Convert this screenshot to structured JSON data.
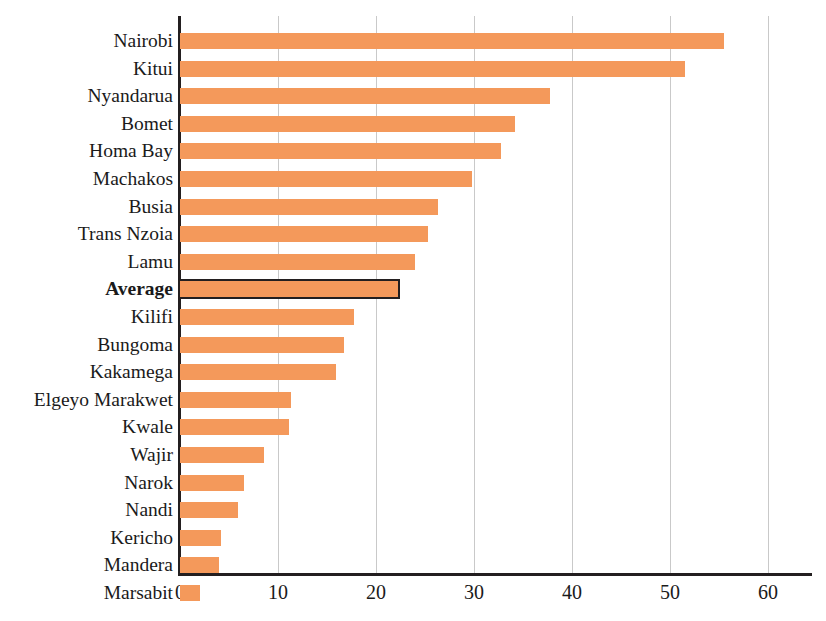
{
  "chart_data": {
    "type": "bar",
    "orientation": "horizontal",
    "title": "",
    "subtitle": "",
    "xlabel": "",
    "ylabel": "",
    "xlim": [
      0,
      65
    ],
    "xticks": [
      0,
      10,
      20,
      30,
      40,
      50,
      60
    ],
    "xtick_labels": [
      "0",
      "10",
      "20",
      "30",
      "40",
      "50",
      "60"
    ],
    "grid": "vertical",
    "legend": "none",
    "bar_color": "#F4995B",
    "highlight_color": "#231f20",
    "categories": [
      "Nairobi",
      "Kitui",
      "Nyandarua",
      "Bomet",
      "Homa Bay",
      "Machakos",
      "Busia",
      "Trans Nzoia",
      "Lamu",
      "Average",
      "Kilifi",
      "Bungoma",
      "Kakamega",
      "Elgeyo Marakwet",
      "Kwale",
      "Wajir",
      "Narok",
      "Nandi",
      "Kericho",
      "Mandera",
      "Marsabit"
    ],
    "values": [
      55.5,
      51.5,
      37.8,
      34.2,
      32.8,
      29.8,
      26.3,
      25.3,
      24.0,
      22.2,
      17.8,
      16.7,
      15.9,
      11.3,
      11.1,
      8.6,
      6.5,
      5.9,
      4.2,
      4.0,
      2.0
    ],
    "highlight_category": "Average",
    "highlight_index": 9
  }
}
